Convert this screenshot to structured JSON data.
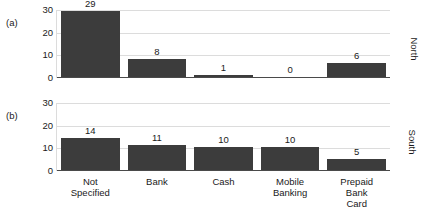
{
  "chart_data": {
    "type": "bar",
    "title": "",
    "xlabel": "",
    "ylabel": "",
    "ylim": [
      0,
      30
    ],
    "yticks": [
      0,
      10,
      20,
      30
    ],
    "grid": true,
    "legend_position": "none",
    "categories": [
      "Not Specified",
      "Bank",
      "Cash",
      "Mobile Banking",
      "Prepaid Bank Card"
    ],
    "category_lines": [
      [
        "Not",
        "Specified"
      ],
      [
        "Bank"
      ],
      [
        "Cash"
      ],
      [
        "Mobile",
        "Banking"
      ],
      [
        "Prepaid",
        "Bank",
        "Card"
      ]
    ],
    "panels": [
      {
        "tag": "(a)",
        "region": "North",
        "values": [
          29,
          8,
          1,
          0,
          6
        ],
        "value_labels": [
          "29",
          "8",
          "1",
          "0",
          "6"
        ]
      },
      {
        "tag": "(b)",
        "region": "South",
        "values": [
          14,
          11,
          10,
          10,
          5
        ],
        "value_labels": [
          "14",
          "11",
          "10",
          "10",
          "5"
        ]
      }
    ],
    "bar_color": "#3c3c3c",
    "grid_color": "#dcdcdc",
    "axis_color": "#4a4a4a"
  }
}
